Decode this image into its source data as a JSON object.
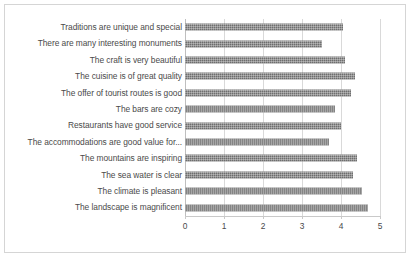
{
  "chart_data": {
    "type": "bar",
    "orientation": "horizontal",
    "title": "",
    "xlabel": "",
    "ylabel": "",
    "xlim": [
      0,
      5
    ],
    "xticks": [
      "0",
      "1",
      "2",
      "3",
      "4",
      "5"
    ],
    "grid": true,
    "legend": "none",
    "bar_color": "#6e6e6e",
    "categories": [
      "Traditions are unique and special",
      "There are many interesting monuments",
      "The craft is very beautiful",
      "The cuisine is of great quality",
      "The offer of tourist routes is good",
      "The bars are cozy",
      "Restaurants have good service",
      "The accommodations are good value for...",
      "The mountains are inspiring",
      "The sea water is clear",
      "The climate is pleasant",
      "The landscape is magnificent"
    ],
    "values": [
      4.05,
      3.5,
      4.1,
      4.35,
      4.25,
      3.85,
      4.0,
      3.7,
      4.4,
      4.3,
      4.55,
      4.7
    ]
  }
}
